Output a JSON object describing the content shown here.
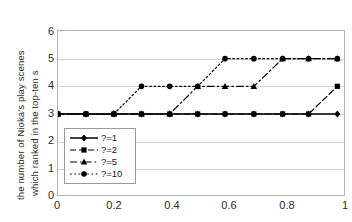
{
  "chart_data": {
    "type": "line",
    "title": "",
    "xlabel": "",
    "ylabel_line1": "the number of Nioka's play scenes",
    "ylabel_line2": "which ranked in the top-ten s",
    "xlim": [
      0,
      1
    ],
    "ylim": [
      0,
      6
    ],
    "xticks": [
      "0",
      "0.2",
      "0.4",
      "0.6",
      "0.8",
      "1"
    ],
    "xtick_values": [
      0,
      0.2,
      0.4,
      0.6,
      0.8,
      1
    ],
    "yticks": [
      "0",
      "1",
      "2",
      "3",
      "4",
      "5",
      "6"
    ],
    "ytick_values": [
      0,
      1,
      2,
      3,
      4,
      5,
      6
    ],
    "grid": "horizontal",
    "legend_position": "lower-left-inside",
    "x": [
      0,
      0.097,
      0.194,
      0.29,
      0.388,
      0.485,
      0.58,
      0.68,
      0.78,
      0.87,
      0.97
    ],
    "series": [
      {
        "name": "?=1",
        "marker": "diamond",
        "linestyle": "solid",
        "color": "#000000",
        "values": [
          3,
          3,
          3,
          3,
          3,
          3,
          3,
          3,
          3,
          3,
          3
        ]
      },
      {
        "name": "?=2",
        "marker": "square",
        "linestyle": "dashed",
        "color": "#000000",
        "values": [
          3,
          3,
          3,
          3,
          3,
          3,
          3,
          3,
          3,
          3,
          4
        ]
      },
      {
        "name": "?=5",
        "marker": "triangle",
        "linestyle": "dash-dot",
        "color": "#000000",
        "values": [
          3,
          3,
          3,
          3,
          3,
          4,
          4,
          4,
          5,
          5,
          5
        ]
      },
      {
        "name": "?=10",
        "marker": "circle",
        "linestyle": "dotted",
        "color": "#000000",
        "values": [
          3,
          3,
          3,
          4,
          4,
          4,
          5,
          5,
          5,
          5,
          5
        ]
      }
    ]
  }
}
